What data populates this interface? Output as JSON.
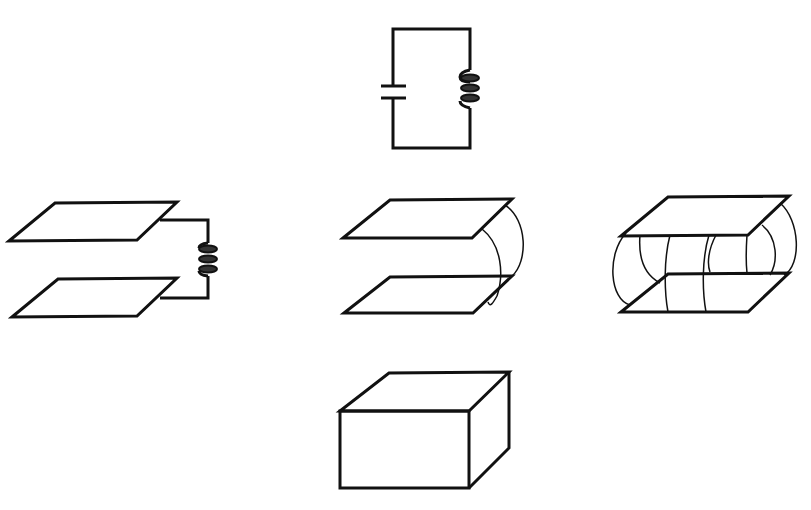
{
  "diagram": {
    "title": "Evolution of an LC circuit into a cavity resonator",
    "stroke_color": "#111111",
    "background": "#ffffff",
    "panels": [
      {
        "id": "lc-circuit",
        "label": "LC circuit with capacitor and inductor coil"
      },
      {
        "id": "plates-with-coil",
        "label": "Parallel plates connected by inductor coil"
      },
      {
        "id": "plates-with-single-loop",
        "label": "Parallel plates connected by single loop"
      },
      {
        "id": "plates-with-many-loops",
        "label": "Parallel plates connected by many loops"
      },
      {
        "id": "closed-box",
        "label": "Closed box cavity resonator"
      }
    ]
  }
}
